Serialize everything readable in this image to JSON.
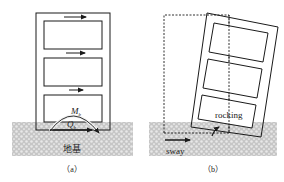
{
  "panels": [
    {
      "id": "a",
      "caption": "（a）",
      "ground_label": "地基",
      "moment_label": "M",
      "moment_sub": "b",
      "shear_label": "Q",
      "shear_sub": "b"
    },
    {
      "id": "b",
      "caption": "（b）",
      "rocking_label": "rocking",
      "sway_label": "sway"
    }
  ],
  "colors": {
    "line": "#1a1a1a",
    "ground_fill": "#c8c8c8",
    "ground_dot": "#e6e6e6",
    "background": "#ffffff"
  }
}
